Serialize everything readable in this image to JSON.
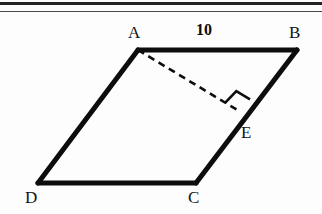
{
  "page": {
    "background_color": "#fdfdfd",
    "width": 322,
    "height": 214
  },
  "scan_artifacts": [
    {
      "name": "top-rule-thick",
      "y": 2,
      "height": 3,
      "color": "#242424"
    },
    {
      "name": "top-rule-thin",
      "y": 11,
      "height": 1,
      "color": "#4a4a4a"
    }
  ],
  "figure": {
    "type": "parallelogram-with-altitude",
    "stroke_color": "#0d0d0d",
    "solid_stroke_width": 5,
    "dashed_stroke_width": 2.6,
    "dash_pattern": "7,5",
    "vertices": {
      "A": {
        "x": 138,
        "y": 50
      },
      "B": {
        "x": 297,
        "y": 50
      },
      "C": {
        "x": 196,
        "y": 183
      },
      "D": {
        "x": 38,
        "y": 183
      },
      "E": {
        "x": 239,
        "y": 111
      }
    },
    "solid_edges": [
      {
        "name": "edge-AB",
        "from": "A",
        "to": "B"
      },
      {
        "name": "edge-BC",
        "from": "B",
        "to": "C"
      },
      {
        "name": "edge-CD",
        "from": "C",
        "to": "D"
      },
      {
        "name": "edge-DA",
        "from": "D",
        "to": "A"
      }
    ],
    "dashed_segments": [
      {
        "name": "altitude-AE",
        "from": "A",
        "to": "E"
      }
    ],
    "right_angle_marker": {
      "name": "right-angle-at-E",
      "vertex": "E",
      "size": 16
    }
  },
  "labels": {
    "vertex_A": {
      "text": "A",
      "x": 128,
      "y": 24
    },
    "vertex_B": {
      "text": "B",
      "x": 289,
      "y": 24
    },
    "vertex_C": {
      "text": "C",
      "x": 188,
      "y": 189
    },
    "vertex_D": {
      "text": "D",
      "x": 25,
      "y": 189
    },
    "vertex_E": {
      "text": "E",
      "x": 241,
      "y": 124
    },
    "side_AB_measure": {
      "text": "10",
      "x": 196,
      "y": 22
    }
  }
}
